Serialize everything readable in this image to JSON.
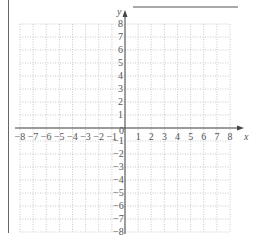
{
  "answer_line": {
    "x1": 133,
    "x2": 238,
    "y": 7
  },
  "grid": {
    "x_min": -8,
    "x_max": 8,
    "y_min": -8,
    "y_max": 8,
    "left_px": 20,
    "right_px": 230,
    "top_px": 24,
    "bottom_px": 232,
    "origin_px": [
      125,
      128
    ],
    "grid_color": "#bbbbbb",
    "axis_color": "#444444"
  },
  "axes": {
    "x_label": "x",
    "y_label": "y",
    "origin_label": "0",
    "x_ticks": [
      "−8",
      "−7",
      "−6",
      "−5",
      "−4",
      "−3",
      "−2",
      "−1",
      "1",
      "2",
      "3",
      "4",
      "5",
      "6",
      "7",
      "8"
    ],
    "y_ticks": [
      "8",
      "7",
      "6",
      "5",
      "4",
      "3",
      "2",
      "1",
      "−1",
      "−2",
      "−3",
      "−4",
      "−5",
      "−6",
      "−7",
      "−8"
    ]
  },
  "chart_data": {
    "type": "scatter",
    "title": "",
    "xlabel": "x",
    "ylabel": "y",
    "xlim": [
      -8,
      8
    ],
    "ylim": [
      -8,
      8
    ],
    "grid": true,
    "x_ticks": [
      -8,
      -7,
      -6,
      -5,
      -4,
      -3,
      -2,
      -1,
      0,
      1,
      2,
      3,
      4,
      5,
      6,
      7,
      8
    ],
    "y_ticks": [
      -8,
      -7,
      -6,
      -5,
      -4,
      -3,
      -2,
      -1,
      0,
      1,
      2,
      3,
      4,
      5,
      6,
      7,
      8
    ],
    "series": []
  }
}
